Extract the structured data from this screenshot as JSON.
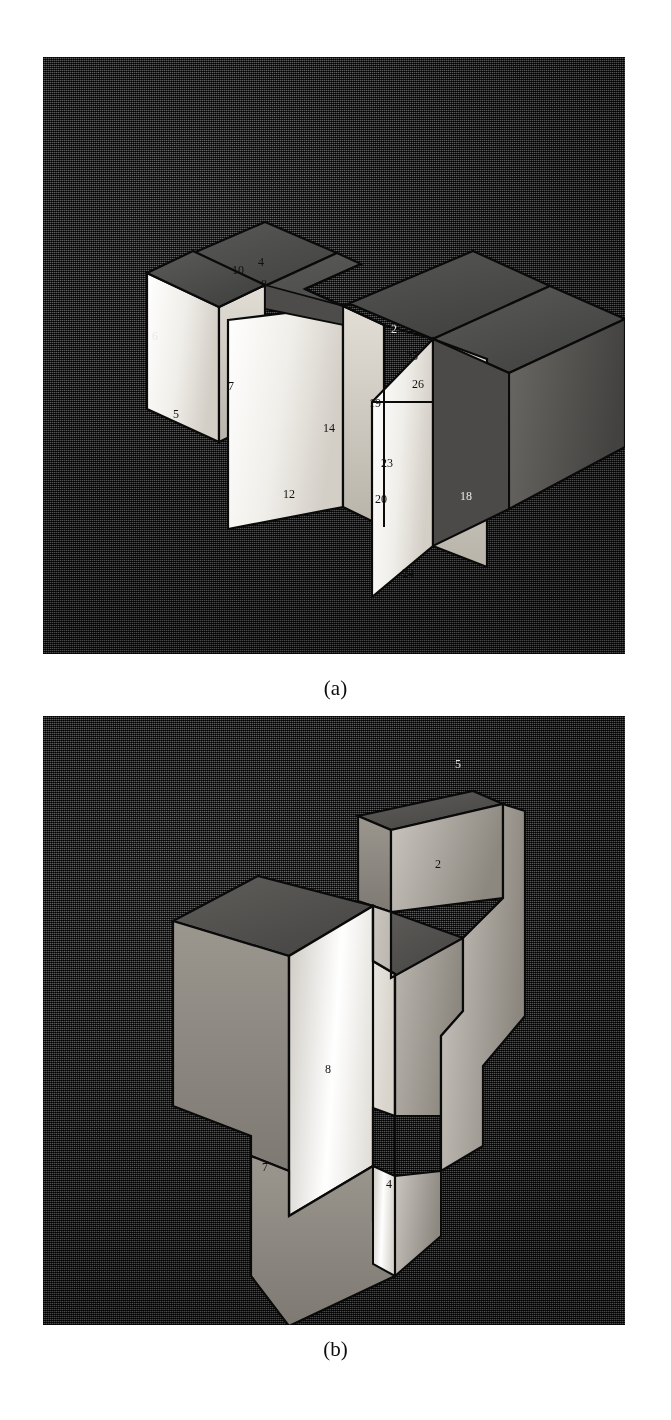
{
  "figure": {
    "panels": [
      {
        "id": "panel-a",
        "caption": "(a)",
        "description": "Isometric shaded 3D solid model with stepped / slotted block geometry and numbered vertex labels",
        "background_color": "#3a3a3a",
        "face_light_color": "#f2f0ec",
        "face_mid_color": "#cfcbc4",
        "face_dark_color": "#4a4a4a",
        "outline_color": "#0a0a0a",
        "labels": [
          {
            "text": "10",
            "x": 232,
            "y": 274
          },
          {
            "text": "4",
            "x": 258,
            "y": 266
          },
          {
            "text": "8",
            "x": 261,
            "y": 288
          },
          {
            "text": "7",
            "x": 228,
            "y": 390
          },
          {
            "text": "12",
            "x": 283,
            "y": 498
          },
          {
            "text": "14",
            "x": 323,
            "y": 432
          },
          {
            "text": "5",
            "x": 173,
            "y": 418
          },
          {
            "text": "6",
            "x": 152,
            "y": 340
          },
          {
            "text": "25",
            "x": 406,
            "y": 360
          },
          {
            "text": "26",
            "x": 412,
            "y": 388
          },
          {
            "text": "19",
            "x": 369,
            "y": 407
          },
          {
            "text": "23",
            "x": 381,
            "y": 467
          },
          {
            "text": "20",
            "x": 375,
            "y": 503
          },
          {
            "text": "24",
            "x": 402,
            "y": 577
          },
          {
            "text": "18",
            "x": 460,
            "y": 500
          },
          {
            "text": "2",
            "x": 391,
            "y": 333
          }
        ]
      },
      {
        "id": "panel-b",
        "caption": "(b)",
        "description": "Isometric shaded 3D solid model of the same part rotated, showing a stepped boss on top and notched lower profile",
        "background_color": "#3a3a3a",
        "face_light_color": "#f2f0ec",
        "face_mid_color": "#c8c4bd",
        "face_dark_color": "#4a4a4a",
        "outline_color": "#0a0a0a",
        "labels": [
          {
            "text": "2",
            "x": 435,
            "y": 868
          },
          {
            "text": "8",
            "x": 325,
            "y": 1073
          },
          {
            "text": "4",
            "x": 386,
            "y": 1188
          },
          {
            "text": "7",
            "x": 262,
            "y": 1171
          },
          {
            "text": "5",
            "x": 455,
            "y": 768
          }
        ]
      }
    ]
  }
}
